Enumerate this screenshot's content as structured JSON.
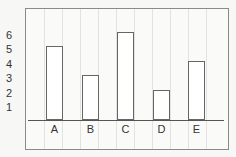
{
  "chart_data": {
    "type": "bar",
    "title": "",
    "xlabel": "",
    "ylabel": "",
    "categories": [
      "A",
      "B",
      "C",
      "D",
      "E"
    ],
    "values": [
      5,
      3,
      6,
      2,
      4
    ],
    "yticks": [
      "1",
      "2",
      "3",
      "4",
      "5",
      "6"
    ],
    "ylim": [
      0,
      6
    ],
    "grid": true,
    "legend": null
  }
}
